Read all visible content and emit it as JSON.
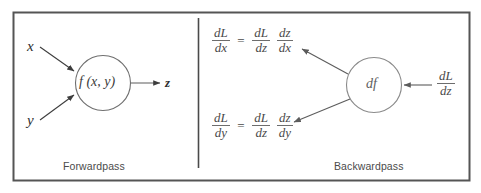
{
  "figure": {
    "border_color": "#555555",
    "divider_color": "#4a4a4a",
    "arrow_color": "#4a4a4a",
    "circle_stroke": "#6f6f6f",
    "text_color": "#4a4a4a"
  },
  "forward": {
    "caption": "Forwardpass",
    "input_x": "x",
    "input_y": "y",
    "node_label": "f (x, y)",
    "output_z": "z"
  },
  "backward": {
    "caption": "Backwardpass",
    "node_label": "df",
    "incoming_gradient": {
      "num": "dL",
      "den": "dz"
    },
    "equation_x": {
      "lhs": {
        "num": "dL",
        "den": "dx"
      },
      "eq": "=",
      "rhs1": {
        "num": "dL",
        "den": "dz"
      },
      "rhs2": {
        "num": "dz",
        "den": "dx"
      }
    },
    "equation_y": {
      "lhs": {
        "num": "dL",
        "den": "dy"
      },
      "eq": "=",
      "rhs1": {
        "num": "dL",
        "den": "dz"
      },
      "rhs2": {
        "num": "dz",
        "den": "dy"
      }
    }
  }
}
